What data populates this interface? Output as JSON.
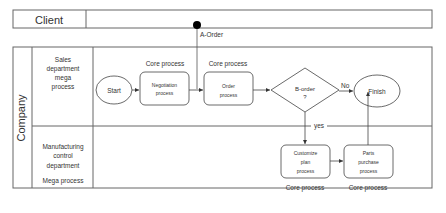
{
  "lanes": {
    "client": {
      "label": "Client"
    },
    "company": {
      "label": "Company"
    },
    "sales": {
      "label_lines": [
        "Sales",
        "department",
        "mega",
        "process"
      ]
    },
    "manufacturing": {
      "label_lines": [
        "Manufacturing",
        "control",
        "department"
      ],
      "sub_label": "Mega process"
    }
  },
  "event": {
    "label": "A-Order"
  },
  "nodes": {
    "start": {
      "label": "Start"
    },
    "negotiation": {
      "lines": [
        "Negotiation",
        "process"
      ],
      "caption": "Core process"
    },
    "order": {
      "lines": [
        "Order",
        "process"
      ],
      "caption": "Core process"
    },
    "decision": {
      "lines": [
        "B-order",
        "?"
      ]
    },
    "finish": {
      "label": "Finish"
    },
    "customize": {
      "lines": [
        "Customize",
        "plan",
        "process"
      ],
      "caption": "Core process"
    },
    "parts": {
      "lines": [
        "Parts",
        "purchase",
        "process"
      ],
      "caption": "Core process"
    }
  },
  "edges": {
    "no_label": "No",
    "yes_label": "yes"
  },
  "colors": {
    "stroke": "#555555",
    "text": "#333333",
    "dot": "#000000"
  }
}
